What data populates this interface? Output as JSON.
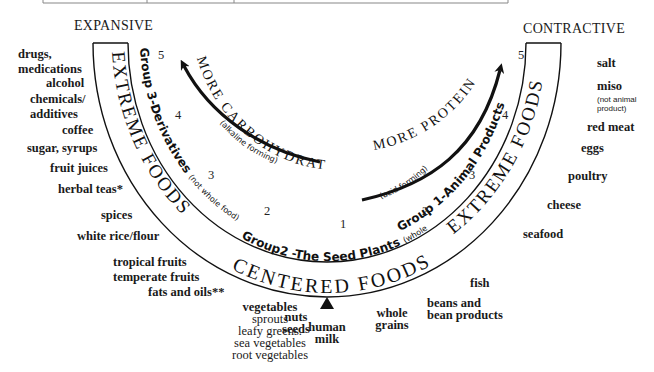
{
  "title_left": "EXPANSIVE",
  "title_right": "CONTRACTIVE",
  "bands": {
    "extreme_left": "EXTREME FOODS",
    "extreme_right": "EXTREME FOODS",
    "centered": "CENTERED FOODS",
    "group3": "Group 3-Derivatives",
    "group3_note": "(not whole food)",
    "group2": "Group2 -The Seed Plants",
    "group2_note": "(whole food)",
    "group1": "Group 1-Animal Products"
  },
  "arrows": {
    "left": {
      "label": "MORE CARBOHYDRATE",
      "note": "(alkaline forming)"
    },
    "right": {
      "label": "MORE PROTEIN",
      "note": "(acid forming)"
    }
  },
  "scale_numbers": {
    "left": [
      "5",
      "4",
      "3",
      "2"
    ],
    "center": "1",
    "right": [
      "2",
      "3",
      "4",
      "5"
    ]
  },
  "left_foods": {
    "drugs": "drugs,\nmedications",
    "alcohol": "alcohol",
    "chemicals": "chemicals/\nadditives",
    "coffee": "coffee",
    "sugar": "sugar, syrups",
    "fruit_juices": "fruit juices",
    "herbal_teas": "herbal teas*",
    "spices": "spices",
    "white_rice": "white rice/flour",
    "fruits": "tropical fruits\ntemperate fruits",
    "fats": "fats and oils**"
  },
  "center_foods": {
    "vegetables_title": "vegetables",
    "vegetables_list": "sprouts\nleafy greens.\nsea vegetables\nroot vegetables",
    "nuts": "nuts\nseeds",
    "human_milk": "human\nmilk",
    "whole_grains": "whole\ngrains",
    "beans": "beans and\nbean products",
    "fish": "fish"
  },
  "right_foods": {
    "salt": "salt",
    "miso": "miso",
    "miso_note": "(not animal\nproduct)",
    "red_meat": "red meat",
    "eggs": "eggs",
    "poultry": "poultry",
    "cheese": "cheese",
    "seafood": "seafood"
  }
}
